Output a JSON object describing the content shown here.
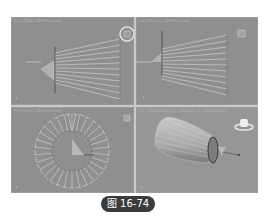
{
  "app": "3ds Max viewports",
  "viewports": [
    {
      "id": "top",
      "label": "[+] [Top] [Wireframe]",
      "nav": "viewcube-icon"
    },
    {
      "id": "front",
      "label": "[+] [Front] [Wireframe]",
      "nav": "viewcube-icon"
    },
    {
      "id": "left",
      "label": "[+] [Left] [Wireframe]",
      "nav": "viewcube-icon"
    },
    {
      "id": "perspective",
      "label": "[+] [Perspective] [Smooth + Highlights]",
      "nav": "viewcube-icon"
    }
  ],
  "caption": "图 16-74",
  "colors": {
    "viewport_bg": "#8f8f8f",
    "frame": "#c9c9c9",
    "wire": "#e6e6e6",
    "caption_bg": "#3b3b3b"
  }
}
